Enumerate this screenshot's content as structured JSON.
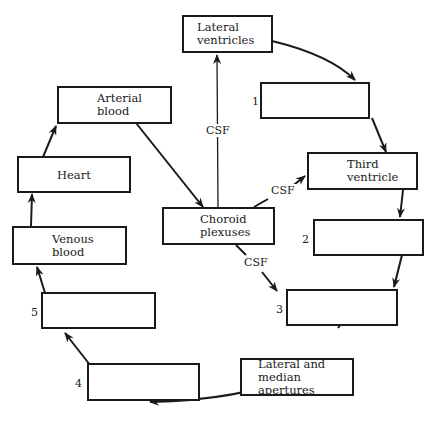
{
  "diagram": {
    "boxes": {
      "lateral_ventricles": "Lateral\nventricles",
      "blank_1": "",
      "third_ventricle": "Third\nventricle",
      "blank_2": "",
      "blank_3": "",
      "lateral_median_apertures": "Lateral and\nmedian apertures",
      "blank_4": "",
      "blank_5": "",
      "venous_blood": "Venous\nblood",
      "heart": "Heart",
      "arterial_blood": "Arterial\nblood",
      "choroid_plexuses": "Choroid\nplexuses"
    },
    "numbers": [
      "1",
      "2",
      "3",
      "4",
      "5"
    ],
    "edge_labels": {
      "to_lateral_ventricles": "CSF",
      "to_third_ventricle": "CSF",
      "to_blank_3": "CSF"
    },
    "colors": {
      "stroke": "#1a1a1a",
      "background": "#ffffff"
    }
  }
}
